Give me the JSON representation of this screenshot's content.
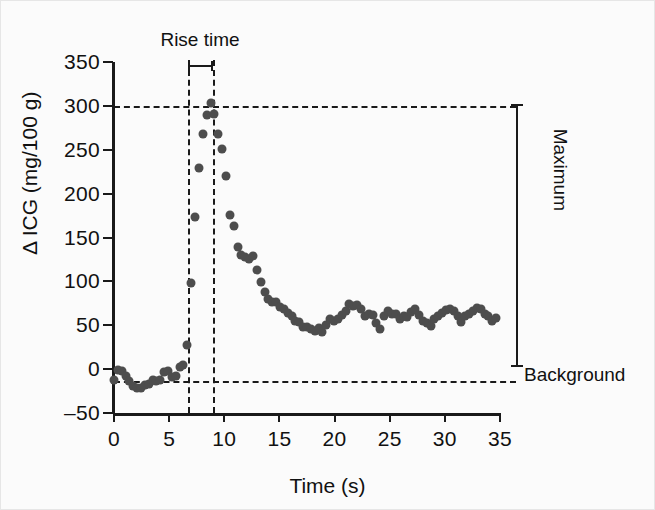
{
  "figure": {
    "background_color": "#fbfbfb",
    "marker_color": "#4d4d4d",
    "axis_color": "#1a1a1a"
  },
  "annotations": {
    "rise_time": "Rise time",
    "maximum": "Maximum",
    "background": "Background"
  },
  "chart_data": {
    "type": "scatter",
    "title": "",
    "xlabel": "Time (s)",
    "ylabel": "Δ ICG (mg/100 g)",
    "xlim": [
      0,
      35
    ],
    "ylim": [
      -50,
      350
    ],
    "xticks": [
      0,
      5,
      10,
      15,
      20,
      25,
      30,
      35
    ],
    "xticklabels": [
      "0",
      "5",
      "10",
      "15",
      "20",
      "25",
      "30",
      "35"
    ],
    "yticks": [
      -50,
      0,
      50,
      100,
      150,
      200,
      250,
      300,
      350
    ],
    "yticklabels": [
      "–50",
      "0",
      "50",
      "100",
      "150",
      "200",
      "250",
      "300",
      "350"
    ],
    "grid": false,
    "legend": null,
    "reference_lines": [
      {
        "name": "maximum",
        "orientation": "horizontal",
        "value": 300,
        "style": "dashed",
        "label": "Maximum"
      },
      {
        "name": "background",
        "orientation": "horizontal",
        "value": -13,
        "style": "dashed",
        "label": "Background"
      },
      {
        "name": "rise-start",
        "orientation": "vertical",
        "value": 6.7,
        "style": "dashed"
      },
      {
        "name": "rise-end",
        "orientation": "vertical",
        "value": 9.0,
        "style": "dashed"
      }
    ],
    "rise_time_interval": [
      6.7,
      9.0
    ],
    "x": [
      0.0,
      0.35,
      0.7,
      1.05,
      1.4,
      1.75,
      2.1,
      2.45,
      2.8,
      3.15,
      3.5,
      3.85,
      4.2,
      4.55,
      4.9,
      5.25,
      5.6,
      5.95,
      6.3,
      6.65,
      7.0,
      7.35,
      7.7,
      8.05,
      8.4,
      8.75,
      9.1,
      9.45,
      9.8,
      10.15,
      10.5,
      10.85,
      11.2,
      11.55,
      11.9,
      12.25,
      12.6,
      12.95,
      13.3,
      13.65,
      14.0,
      14.35,
      14.7,
      15.05,
      15.4,
      15.75,
      16.1,
      16.45,
      16.8,
      17.15,
      17.5,
      17.85,
      18.2,
      18.55,
      18.9,
      19.25,
      19.6,
      19.95,
      20.3,
      20.65,
      21.0,
      21.35,
      21.7,
      22.05,
      22.4,
      22.75,
      23.1,
      23.45,
      23.8,
      24.15,
      24.5,
      24.85,
      25.2,
      25.55,
      25.9,
      26.25,
      26.6,
      26.95,
      27.3,
      27.65,
      28.0,
      28.35,
      28.7,
      29.05,
      29.4,
      29.75,
      30.1,
      30.45,
      30.8,
      31.15,
      31.5,
      31.85,
      32.2,
      32.55,
      32.9,
      33.25,
      33.6,
      33.95,
      34.3,
      34.65
    ],
    "y": [
      -12,
      -1,
      -2,
      -8,
      -13,
      -19,
      -22,
      -22,
      -18,
      -17,
      -12,
      -13,
      -12,
      -3,
      -2,
      -9,
      -8,
      2,
      5,
      28,
      98,
      173,
      229,
      268,
      290,
      303,
      291,
      268,
      251,
      220,
      176,
      163,
      139,
      130,
      128,
      126,
      129,
      113,
      99,
      88,
      80,
      76,
      76,
      71,
      69,
      64,
      60,
      55,
      54,
      48,
      48,
      46,
      44,
      47,
      42,
      50,
      57,
      55,
      57,
      62,
      66,
      74,
      72,
      73,
      68,
      60,
      63,
      62,
      53,
      46,
      61,
      66,
      63,
      63,
      57,
      61,
      59,
      65,
      68,
      62,
      55,
      52,
      49,
      57,
      61,
      64,
      67,
      68,
      66,
      60,
      54,
      60,
      63,
      66,
      70,
      69,
      63,
      61,
      55,
      58
    ]
  }
}
